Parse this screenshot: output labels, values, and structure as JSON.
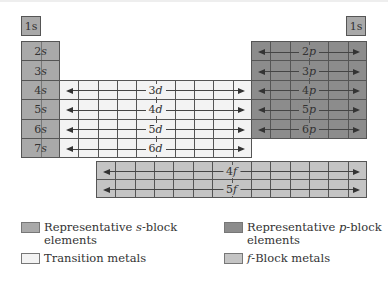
{
  "diagram": {
    "s_block": {
      "top_left": "1s",
      "top_right": "1s",
      "rows": [
        "2s",
        "3s",
        "4s",
        "5s",
        "6s",
        "7s"
      ]
    },
    "d_block": {
      "rows": [
        "3d",
        "4d",
        "5d",
        "6d"
      ]
    },
    "p_block": {
      "rows": [
        "2p",
        "3p",
        "4p",
        "5p",
        "6p"
      ]
    },
    "f_block": {
      "rows": [
        "4f",
        "5f"
      ]
    },
    "colors": {
      "s_block": "#a9a9a9",
      "p_block": "#8c8c8c",
      "d_block": "#f3f3f3",
      "f_block": "#c4c4c4"
    }
  },
  "legend": [
    {
      "pre": "Representative ",
      "ital": "s",
      "post": "-block",
      "line2": "elements",
      "color": "#a9a9a9"
    },
    {
      "pre": "Representative ",
      "ital": "p",
      "post": "-block",
      "line2": "elements",
      "color": "#8c8c8c"
    },
    {
      "pre": "",
      "ital": "",
      "post": "Transition metals",
      "line2": "",
      "color": "#f3f3f3"
    },
    {
      "pre": "",
      "ital": "f",
      "post": "-Block metals",
      "line2": "",
      "color": "#c4c4c4"
    }
  ]
}
